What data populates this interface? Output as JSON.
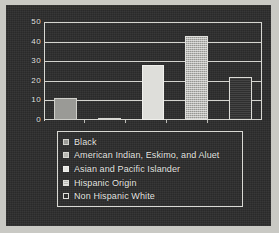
{
  "chart_data": {
    "type": "bar",
    "title": "",
    "subtitle": "",
    "xlabel": "",
    "ylabel": "",
    "ylim": [
      0,
      50
    ],
    "yticks": [
      "0",
      "10",
      "20",
      "30",
      "40",
      "50"
    ],
    "ytick_values": [
      0,
      10,
      20,
      30,
      40,
      50
    ],
    "grid": true,
    "legend_position": "bottom",
    "categories": [
      "Black",
      "American Indian, Eskimo, and Aluet",
      "Asian and Pacific Islander",
      "Hispanic Origin",
      "Non Hispanic White"
    ],
    "values": [
      11,
      1,
      28,
      43,
      22
    ],
    "colors": [
      "#9a9a96",
      "#b8b8b3",
      "#dededa",
      "#b6b6b1",
      "#2f2f2f"
    ],
    "series": [
      {
        "name": "",
        "values": [
          11,
          1,
          28,
          43,
          22
        ]
      }
    ]
  },
  "legend": {
    "items": [
      {
        "label": "Black",
        "swatch": "#9a9a96"
      },
      {
        "label": "American Indian, Eskimo, and Aluet",
        "swatch": "#b8b8b3"
      },
      {
        "label": "Asian and Pacific Islander",
        "swatch": "#e6e6e2"
      },
      {
        "label": "Hispanic Origin",
        "swatch": "#b6b6b1"
      },
      {
        "label": "Non Hispanic White",
        "swatch": "#2f2f2f"
      }
    ]
  },
  "theme": {
    "panel_background": "#2a2a2a",
    "page_background": "#c9c9c4",
    "axis_color": "#d4d4cf",
    "text_color": "#e8e8e4"
  }
}
